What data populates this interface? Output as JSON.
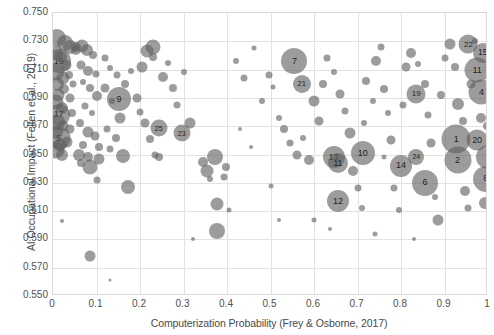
{
  "chart_data": {
    "type": "scatter",
    "title": "",
    "xlabel": "Computerization Probability (Frey & Osborne, 2017)",
    "ylabel": "AI Occupational Impact (Felten et al., 2019)",
    "xlim": [
      0,
      1
    ],
    "ylim": [
      0.55,
      0.75
    ],
    "x_ticks": [
      "0",
      "0.1",
      "0.2",
      "0.3",
      "0.4",
      "0.5",
      "0.6",
      "0.7",
      "0.8",
      "0.9",
      "1"
    ],
    "x_tick_values": [
      0,
      0.1,
      0.2,
      0.3,
      0.4,
      0.5,
      0.6,
      0.7,
      0.8,
      0.9,
      1
    ],
    "y_ticks": [
      "0.750",
      "0.730",
      "0.710",
      "0.690",
      "0.670",
      "0.650",
      "0.630",
      "0.610",
      "0.590",
      "0.570",
      "0.550"
    ],
    "y_tick_values": [
      0.75,
      0.73,
      0.71,
      0.69,
      0.67,
      0.65,
      0.63,
      0.61,
      0.59,
      0.57,
      0.55
    ],
    "grid": true,
    "legend": "none",
    "marker_color": "#5f5f5f",
    "marker_opacity": 0.62,
    "size_encoding": "employment size (bubble area)",
    "points": [
      {
        "x": 0.955,
        "y": 0.728,
        "r": 9.5,
        "label": "22"
      },
      {
        "x": 0.988,
        "y": 0.722,
        "r": 10.0,
        "label": "15"
      },
      {
        "x": 0.975,
        "y": 0.71,
        "r": 12.5,
        "label": "11"
      },
      {
        "x": 0.985,
        "y": 0.694,
        "r": 12.5,
        "label": "4"
      },
      {
        "x": 0.835,
        "y": 0.693,
        "r": 9.5,
        "label": "19"
      },
      {
        "x": 0.555,
        "y": 0.716,
        "r": 13.0,
        "label": "7"
      },
      {
        "x": 0.572,
        "y": 0.7,
        "r": 9.0,
        "label": "21"
      },
      {
        "x": 0.927,
        "y": 0.661,
        "r": 14.5,
        "label": "1"
      },
      {
        "x": 0.975,
        "y": 0.66,
        "r": 10.5,
        "label": "20"
      },
      {
        "x": 1.0,
        "y": 0.648,
        "r": 12.0,
        "label": "7"
      },
      {
        "x": 0.93,
        "y": 0.646,
        "r": 13.5,
        "label": "2"
      },
      {
        "x": 0.995,
        "y": 0.633,
        "r": 13.0,
        "label": "8"
      },
      {
        "x": 0.835,
        "y": 0.648,
        "r": 8.0,
        "label": "24"
      },
      {
        "x": 0.8,
        "y": 0.642,
        "r": 11.0,
        "label": "14"
      },
      {
        "x": 0.855,
        "y": 0.63,
        "r": 13.0,
        "label": "6"
      },
      {
        "x": 0.712,
        "y": 0.651,
        "r": 12.0,
        "label": "10"
      },
      {
        "x": 0.645,
        "y": 0.648,
        "r": 11.0,
        "label": "13"
      },
      {
        "x": 0.655,
        "y": 0.644,
        "r": 10.0,
        "label": "11"
      },
      {
        "x": 0.655,
        "y": 0.617,
        "r": 11.0,
        "label": "12"
      },
      {
        "x": 0.013,
        "y": 0.716,
        "r": 12.0,
        "label": "16"
      },
      {
        "x": 0.013,
        "y": 0.678,
        "r": 11.0,
        "label": "17"
      },
      {
        "x": 0.013,
        "y": 0.662,
        "r": 11.5,
        "label": "5"
      },
      {
        "x": 0.152,
        "y": 0.689,
        "r": 12.0,
        "label": "9"
      },
      {
        "x": 0.243,
        "y": 0.669,
        "r": 8.5,
        "label": "25"
      },
      {
        "x": 0.296,
        "y": 0.665,
        "r": 8.5,
        "label": "23"
      },
      {
        "x": 0.01,
        "y": 0.732,
        "r": 9.0,
        "label": ""
      },
      {
        "x": 0.028,
        "y": 0.729,
        "r": 8.0,
        "label": ""
      },
      {
        "x": 0.04,
        "y": 0.726,
        "r": 7.0,
        "label": ""
      },
      {
        "x": 0.052,
        "y": 0.724,
        "r": 5.0,
        "label": ""
      },
      {
        "x": 0.006,
        "y": 0.722,
        "r": 7.0,
        "label": ""
      },
      {
        "x": 0.018,
        "y": 0.719,
        "r": 6.0,
        "label": ""
      },
      {
        "x": 0.03,
        "y": 0.713,
        "r": 5.5,
        "label": ""
      },
      {
        "x": 0.008,
        "y": 0.708,
        "r": 8.5,
        "label": ""
      },
      {
        "x": 0.022,
        "y": 0.704,
        "r": 6.5,
        "label": ""
      },
      {
        "x": 0.01,
        "y": 0.7,
        "r": 7.0,
        "label": ""
      },
      {
        "x": 0.026,
        "y": 0.696,
        "r": 5.0,
        "label": ""
      },
      {
        "x": 0.012,
        "y": 0.692,
        "r": 6.5,
        "label": ""
      },
      {
        "x": 0.006,
        "y": 0.687,
        "r": 7.5,
        "label": ""
      },
      {
        "x": 0.02,
        "y": 0.683,
        "r": 6.0,
        "label": ""
      },
      {
        "x": 0.01,
        "y": 0.673,
        "r": 8.0,
        "label": ""
      },
      {
        "x": 0.024,
        "y": 0.67,
        "r": 5.5,
        "label": ""
      },
      {
        "x": 0.008,
        "y": 0.666,
        "r": 7.0,
        "label": ""
      },
      {
        "x": 0.016,
        "y": 0.657,
        "r": 6.5,
        "label": ""
      },
      {
        "x": 0.006,
        "y": 0.653,
        "r": 8.5,
        "label": ""
      },
      {
        "x": 0.02,
        "y": 0.65,
        "r": 6.0,
        "label": ""
      },
      {
        "x": 0.032,
        "y": 0.659,
        "r": 5.5,
        "label": ""
      },
      {
        "x": 0.038,
        "y": 0.668,
        "r": 4.5,
        "label": ""
      },
      {
        "x": 0.044,
        "y": 0.679,
        "r": 4.0,
        "label": ""
      },
      {
        "x": 0.04,
        "y": 0.69,
        "r": 4.5,
        "label": ""
      },
      {
        "x": 0.046,
        "y": 0.7,
        "r": 3.5,
        "label": ""
      },
      {
        "x": 0.036,
        "y": 0.706,
        "r": 4.0,
        "label": ""
      },
      {
        "x": 0.052,
        "y": 0.726,
        "r": 5.0,
        "label": ""
      },
      {
        "x": 0.066,
        "y": 0.727,
        "r": 6.5,
        "label": ""
      },
      {
        "x": 0.078,
        "y": 0.724,
        "r": 6.0,
        "label": ""
      },
      {
        "x": 0.092,
        "y": 0.72,
        "r": 4.0,
        "label": ""
      },
      {
        "x": 0.064,
        "y": 0.713,
        "r": 4.5,
        "label": ""
      },
      {
        "x": 0.08,
        "y": 0.709,
        "r": 5.0,
        "label": ""
      },
      {
        "x": 0.098,
        "y": 0.707,
        "r": 3.5,
        "label": ""
      },
      {
        "x": 0.07,
        "y": 0.701,
        "r": 3.0,
        "label": ""
      },
      {
        "x": 0.086,
        "y": 0.697,
        "r": 4.0,
        "label": ""
      },
      {
        "x": 0.1,
        "y": 0.691,
        "r": 5.0,
        "label": ""
      },
      {
        "x": 0.074,
        "y": 0.684,
        "r": 3.5,
        "label": ""
      },
      {
        "x": 0.09,
        "y": 0.679,
        "r": 3.0,
        "label": ""
      },
      {
        "x": 0.063,
        "y": 0.672,
        "r": 4.0,
        "label": ""
      },
      {
        "x": 0.081,
        "y": 0.666,
        "r": 5.5,
        "label": ""
      },
      {
        "x": 0.096,
        "y": 0.663,
        "r": 4.5,
        "label": ""
      },
      {
        "x": 0.07,
        "y": 0.657,
        "r": 4.0,
        "label": ""
      },
      {
        "x": 0.06,
        "y": 0.65,
        "r": 6.0,
        "label": ""
      },
      {
        "x": 0.08,
        "y": 0.648,
        "r": 5.0,
        "label": ""
      },
      {
        "x": 0.086,
        "y": 0.641,
        "r": 7.5,
        "label": ""
      },
      {
        "x": 0.065,
        "y": 0.644,
        "r": 4.0,
        "label": ""
      },
      {
        "x": 0.105,
        "y": 0.647,
        "r": 5.5,
        "label": ""
      },
      {
        "x": 0.1,
        "y": 0.632,
        "r": 3.5,
        "label": ""
      },
      {
        "x": 0.084,
        "y": 0.578,
        "r": 5.5,
        "label": ""
      },
      {
        "x": 0.105,
        "y": 0.655,
        "r": 4.0,
        "label": ""
      },
      {
        "x": 0.12,
        "y": 0.718,
        "r": 3.5,
        "label": ""
      },
      {
        "x": 0.132,
        "y": 0.711,
        "r": 3.0,
        "label": ""
      },
      {
        "x": 0.146,
        "y": 0.706,
        "r": 3.5,
        "label": ""
      },
      {
        "x": 0.12,
        "y": 0.697,
        "r": 4.5,
        "label": ""
      },
      {
        "x": 0.135,
        "y": 0.688,
        "r": 3.0,
        "label": ""
      },
      {
        "x": 0.155,
        "y": 0.676,
        "r": 5.5,
        "label": ""
      },
      {
        "x": 0.125,
        "y": 0.668,
        "r": 3.5,
        "label": ""
      },
      {
        "x": 0.145,
        "y": 0.662,
        "r": 4.0,
        "label": ""
      },
      {
        "x": 0.16,
        "y": 0.649,
        "r": 7.0,
        "label": ""
      },
      {
        "x": 0.13,
        "y": 0.654,
        "r": 3.5,
        "label": ""
      },
      {
        "x": 0.173,
        "y": 0.627,
        "r": 7.0,
        "label": ""
      },
      {
        "x": 0.165,
        "y": 0.7,
        "r": 4.0,
        "label": ""
      },
      {
        "x": 0.18,
        "y": 0.709,
        "r": 3.0,
        "label": ""
      },
      {
        "x": 0.192,
        "y": 0.69,
        "r": 4.5,
        "label": ""
      },
      {
        "x": 0.205,
        "y": 0.712,
        "r": 5.5,
        "label": ""
      },
      {
        "x": 0.215,
        "y": 0.723,
        "r": 6.5,
        "label": ""
      },
      {
        "x": 0.23,
        "y": 0.719,
        "r": 4.0,
        "label": ""
      },
      {
        "x": 0.2,
        "y": 0.68,
        "r": 3.5,
        "label": ""
      },
      {
        "x": 0.212,
        "y": 0.672,
        "r": 4.5,
        "label": ""
      },
      {
        "x": 0.222,
        "y": 0.661,
        "r": 4.0,
        "label": ""
      },
      {
        "x": 0.235,
        "y": 0.65,
        "r": 3.5,
        "label": ""
      },
      {
        "x": 0.244,
        "y": 0.648,
        "r": 4.0,
        "label": ""
      },
      {
        "x": 0.23,
        "y": 0.726,
        "r": 7.5,
        "label": ""
      },
      {
        "x": 0.252,
        "y": 0.705,
        "r": 5.0,
        "label": ""
      },
      {
        "x": 0.265,
        "y": 0.715,
        "r": 3.0,
        "label": ""
      },
      {
        "x": 0.275,
        "y": 0.697,
        "r": 4.0,
        "label": ""
      },
      {
        "x": 0.285,
        "y": 0.685,
        "r": 3.5,
        "label": ""
      },
      {
        "x": 0.3,
        "y": 0.708,
        "r": 3.0,
        "label": ""
      },
      {
        "x": 0.316,
        "y": 0.672,
        "r": 5.5,
        "label": ""
      },
      {
        "x": 0.345,
        "y": 0.645,
        "r": 5.0,
        "label": ""
      },
      {
        "x": 0.355,
        "y": 0.638,
        "r": 6.5,
        "label": ""
      },
      {
        "x": 0.372,
        "y": 0.648,
        "r": 8.0,
        "label": ""
      },
      {
        "x": 0.378,
        "y": 0.615,
        "r": 6.5,
        "label": ""
      },
      {
        "x": 0.378,
        "y": 0.596,
        "r": 8.0,
        "label": ""
      },
      {
        "x": 0.362,
        "y": 0.633,
        "r": 3.0,
        "label": ""
      },
      {
        "x": 0.392,
        "y": 0.634,
        "r": 3.5,
        "label": ""
      },
      {
        "x": 0.398,
        "y": 0.641,
        "r": 4.0,
        "label": ""
      },
      {
        "x": 0.405,
        "y": 0.611,
        "r": 2.5,
        "label": ""
      },
      {
        "x": 0.322,
        "y": 0.59,
        "r": 2.0,
        "label": ""
      },
      {
        "x": 0.13,
        "y": 0.561,
        "r": 1.5,
        "label": ""
      },
      {
        "x": 0.02,
        "y": 0.603,
        "r": 2.0,
        "label": ""
      },
      {
        "x": 0.42,
        "y": 0.716,
        "r": 3.0,
        "label": ""
      },
      {
        "x": 0.44,
        "y": 0.704,
        "r": 3.5,
        "label": ""
      },
      {
        "x": 0.462,
        "y": 0.725,
        "r": 2.5,
        "label": ""
      },
      {
        "x": 0.48,
        "y": 0.688,
        "r": 3.0,
        "label": ""
      },
      {
        "x": 0.496,
        "y": 0.706,
        "r": 3.5,
        "label": ""
      },
      {
        "x": 0.505,
        "y": 0.698,
        "r": 2.5,
        "label": ""
      },
      {
        "x": 0.52,
        "y": 0.676,
        "r": 3.0,
        "label": ""
      },
      {
        "x": 0.53,
        "y": 0.668,
        "r": 4.0,
        "label": ""
      },
      {
        "x": 0.545,
        "y": 0.658,
        "r": 3.5,
        "label": ""
      },
      {
        "x": 0.56,
        "y": 0.65,
        "r": 4.5,
        "label": ""
      },
      {
        "x": 0.575,
        "y": 0.662,
        "r": 3.0,
        "label": ""
      },
      {
        "x": 0.588,
        "y": 0.646,
        "r": 5.0,
        "label": ""
      },
      {
        "x": 0.6,
        "y": 0.688,
        "r": 5.5,
        "label": ""
      },
      {
        "x": 0.612,
        "y": 0.674,
        "r": 4.5,
        "label": ""
      },
      {
        "x": 0.62,
        "y": 0.7,
        "r": 4.0,
        "label": ""
      },
      {
        "x": 0.63,
        "y": 0.718,
        "r": 3.5,
        "label": ""
      },
      {
        "x": 0.645,
        "y": 0.708,
        "r": 3.0,
        "label": ""
      },
      {
        "x": 0.66,
        "y": 0.693,
        "r": 4.5,
        "label": ""
      },
      {
        "x": 0.672,
        "y": 0.681,
        "r": 3.5,
        "label": ""
      },
      {
        "x": 0.682,
        "y": 0.665,
        "r": 5.5,
        "label": ""
      },
      {
        "x": 0.69,
        "y": 0.638,
        "r": 5.0,
        "label": ""
      },
      {
        "x": 0.7,
        "y": 0.626,
        "r": 3.5,
        "label": ""
      },
      {
        "x": 0.71,
        "y": 0.612,
        "r": 3.0,
        "label": ""
      },
      {
        "x": 0.715,
        "y": 0.672,
        "r": 3.0,
        "label": ""
      },
      {
        "x": 0.72,
        "y": 0.702,
        "r": 4.0,
        "label": ""
      },
      {
        "x": 0.735,
        "y": 0.688,
        "r": 3.0,
        "label": ""
      },
      {
        "x": 0.742,
        "y": 0.716,
        "r": 5.0,
        "label": ""
      },
      {
        "x": 0.755,
        "y": 0.726,
        "r": 3.5,
        "label": ""
      },
      {
        "x": 0.762,
        "y": 0.696,
        "r": 4.0,
        "label": ""
      },
      {
        "x": 0.77,
        "y": 0.679,
        "r": 3.0,
        "label": ""
      },
      {
        "x": 0.778,
        "y": 0.66,
        "r": 4.5,
        "label": ""
      },
      {
        "x": 0.785,
        "y": 0.626,
        "r": 3.5,
        "label": ""
      },
      {
        "x": 0.796,
        "y": 0.611,
        "r": 3.0,
        "label": ""
      },
      {
        "x": 0.805,
        "y": 0.685,
        "r": 3.5,
        "label": ""
      },
      {
        "x": 0.812,
        "y": 0.712,
        "r": 4.5,
        "label": ""
      },
      {
        "x": 0.822,
        "y": 0.722,
        "r": 5.0,
        "label": ""
      },
      {
        "x": 0.84,
        "y": 0.714,
        "r": 3.0,
        "label": ""
      },
      {
        "x": 0.855,
        "y": 0.7,
        "r": 4.0,
        "label": ""
      },
      {
        "x": 0.862,
        "y": 0.678,
        "r": 3.5,
        "label": ""
      },
      {
        "x": 0.87,
        "y": 0.658,
        "r": 4.5,
        "label": ""
      },
      {
        "x": 0.878,
        "y": 0.62,
        "r": 3.0,
        "label": ""
      },
      {
        "x": 0.885,
        "y": 0.604,
        "r": 5.5,
        "label": ""
      },
      {
        "x": 0.892,
        "y": 0.692,
        "r": 4.0,
        "label": ""
      },
      {
        "x": 0.9,
        "y": 0.718,
        "r": 3.5,
        "label": ""
      },
      {
        "x": 0.912,
        "y": 0.728,
        "r": 5.5,
        "label": ""
      },
      {
        "x": 0.925,
        "y": 0.712,
        "r": 4.0,
        "label": ""
      },
      {
        "x": 0.93,
        "y": 0.686,
        "r": 6.0,
        "label": ""
      },
      {
        "x": 0.942,
        "y": 0.674,
        "r": 4.0,
        "label": ""
      },
      {
        "x": 0.948,
        "y": 0.624,
        "r": 5.0,
        "label": ""
      },
      {
        "x": 0.955,
        "y": 0.612,
        "r": 3.5,
        "label": ""
      },
      {
        "x": 0.962,
        "y": 0.7,
        "r": 4.5,
        "label": ""
      },
      {
        "x": 0.97,
        "y": 0.73,
        "r": 3.0,
        "label": ""
      },
      {
        "x": 0.985,
        "y": 0.676,
        "r": 5.0,
        "label": ""
      },
      {
        "x": 0.992,
        "y": 0.616,
        "r": 6.0,
        "label": ""
      },
      {
        "x": 0.998,
        "y": 0.67,
        "r": 4.0,
        "label": ""
      },
      {
        "x": 0.455,
        "y": 0.655,
        "r": 2.0,
        "label": ""
      },
      {
        "x": 0.5,
        "y": 0.628,
        "r": 2.5,
        "label": ""
      },
      {
        "x": 0.52,
        "y": 0.604,
        "r": 2.0,
        "label": ""
      },
      {
        "x": 0.6,
        "y": 0.604,
        "r": 2.5,
        "label": ""
      },
      {
        "x": 0.636,
        "y": 0.597,
        "r": 2.0,
        "label": ""
      },
      {
        "x": 0.74,
        "y": 0.594,
        "r": 2.5,
        "label": ""
      },
      {
        "x": 0.83,
        "y": 0.59,
        "r": 2.0,
        "label": ""
      },
      {
        "x": 0.76,
        "y": 0.648,
        "r": 2.5,
        "label": ""
      },
      {
        "x": 0.43,
        "y": 0.668,
        "r": 2.0,
        "label": ""
      }
    ]
  }
}
